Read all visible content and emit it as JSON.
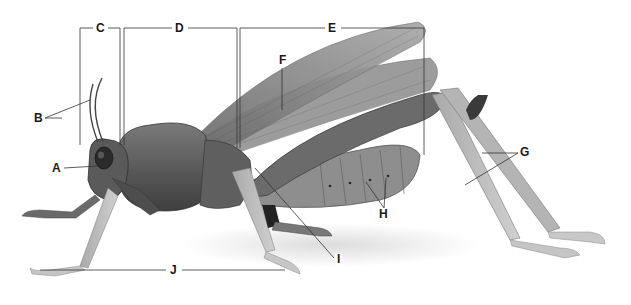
{
  "diagram": {
    "labels": [
      {
        "id": "A",
        "text": "A",
        "x": 52,
        "y": 162
      },
      {
        "id": "B",
        "text": "B",
        "x": 33,
        "y": 112
      },
      {
        "id": "C",
        "text": "C",
        "x": 95,
        "y": 22
      },
      {
        "id": "D",
        "text": "D",
        "x": 175,
        "y": 22
      },
      {
        "id": "E",
        "text": "E",
        "x": 328,
        "y": 22
      },
      {
        "id": "F",
        "text": "F",
        "x": 280,
        "y": 53
      },
      {
        "id": "G",
        "text": "G",
        "x": 520,
        "y": 148
      },
      {
        "id": "H",
        "text": "H",
        "x": 378,
        "y": 212
      },
      {
        "id": "I",
        "text": "I",
        "x": 336,
        "y": 253
      },
      {
        "id": "J",
        "text": "J",
        "x": 170,
        "y": 263
      }
    ]
  },
  "colors": {
    "body_dark": "#4a4a4a",
    "body_mid": "#6e6e6e",
    "body_light": "#9a9a9a",
    "leg_light": "#bdbdbd",
    "wing": "#8a8a8a",
    "line": "#333333",
    "shadow": "#e6e6e6"
  }
}
